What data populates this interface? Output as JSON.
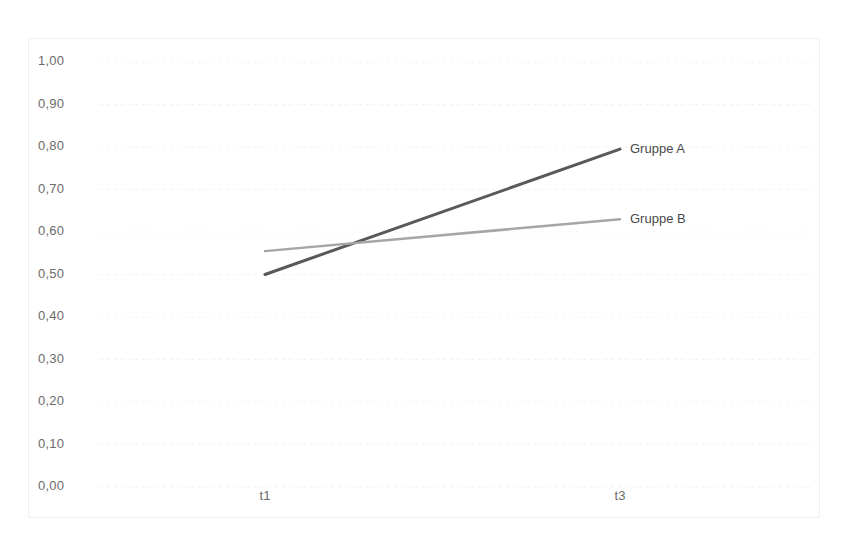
{
  "chart_data": {
    "type": "line",
    "title": "",
    "xlabel": "",
    "ylabel": "",
    "categories": [
      "t1",
      "t3"
    ],
    "x": [
      0,
      1
    ],
    "ylim": [
      0.0,
      1.0
    ],
    "ytick_labels": [
      "1,00",
      "0,90",
      "0,80",
      "0,70",
      "0,60",
      "0,50",
      "0,40",
      "0,30",
      "0,20",
      "0,10",
      "0,00"
    ],
    "ytick_values": [
      1.0,
      0.9,
      0.8,
      0.7,
      0.6,
      0.5,
      0.4,
      0.3,
      0.2,
      0.1,
      0.0
    ],
    "grid": true,
    "grid_style": "dotted",
    "legend_position": "inline-right-of-line-ends",
    "decimal_separator": ",",
    "series": [
      {
        "name": "Gruppe A",
        "values": [
          0.5,
          0.795
        ],
        "color": "#595959",
        "line_width": 3
      },
      {
        "name": "Gruppe B",
        "values": [
          0.555,
          0.63
        ],
        "color": "#a6a6a6",
        "line_width": 2.5
      }
    ],
    "annotations": {
      "crossing_point": {
        "x": 0.31,
        "y": 0.575
      }
    },
    "colors": {
      "grid": "#f2f2f2",
      "frame": "#f0f0f0",
      "tick_text": "#6b6b6b",
      "background": "#ffffff"
    }
  }
}
